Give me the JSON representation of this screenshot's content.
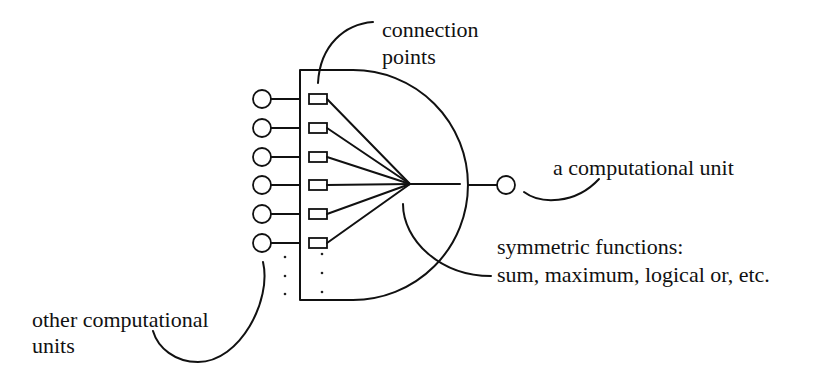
{
  "diagram": {
    "labels": {
      "connection_points": [
        "connection",
        "points"
      ],
      "computational_unit": "a computational unit",
      "symmetric_functions": [
        "symmetric functions:",
        "sum, maximum, logical or, etc."
      ],
      "other_units": [
        "other computational",
        "units"
      ]
    },
    "inputs": {
      "count_visible": 6,
      "ellipsis": "vertical dots"
    },
    "colors": {
      "ink": "#111111",
      "background": "#ffffff"
    }
  }
}
